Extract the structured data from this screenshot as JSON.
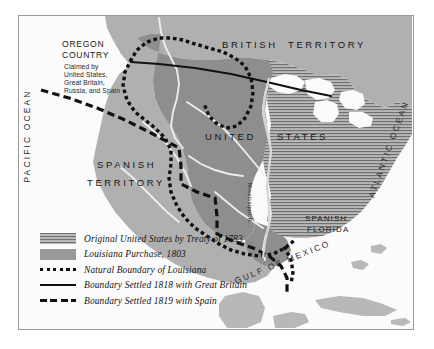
{
  "map": {
    "title_regions": {
      "british_territory": "BRITISH  TERRITORY",
      "united_states": "UNITED    STATES",
      "spanish_territory_line1": "SPANISH",
      "spanish_territory_line2": "TERRITORY",
      "spanish_florida_line1": "SPANISH",
      "spanish_florida_line2": "FLORIDA",
      "oregon_line1": "OREGON",
      "oregon_line2": "COUNTRY",
      "oregon_claim_line1": "Claimed by",
      "oregon_claim_line2": "United States,",
      "oregon_claim_line3": "Great Britain,",
      "oregon_claim_line4": "Russia, and Spain"
    },
    "water_labels": {
      "pacific_ocean": "PACIFIC OCEAN",
      "atlantic_ocean": "ATLANTIC OCEAN",
      "gulf_of_mexico": "GULF OF MEXICO",
      "mississippi_river": "Mississippi R."
    },
    "colors": {
      "louisiana_purchase_fill": "#8e8e8e",
      "spanish_territory_fill": "#b0b0b0",
      "british_territory_fill": "#b0b0b0",
      "original_us_hatch_dark": "#6f6f6f",
      "original_us_hatch_light": "#b9b9b9",
      "water_fill": "#fbfbfb",
      "river_color": "#ededed",
      "boundary_color": "#111111",
      "frame_color": "#9a9a9a"
    },
    "legend": {
      "items": [
        {
          "key": "hatch-swatch",
          "label": "Original United States by Treaty of 1783"
        },
        {
          "key": "solid-swatch",
          "label": "Louisiana Purchase, 1803"
        },
        {
          "key": "dotted-line",
          "label": "Natural Boundary of Louisiana"
        },
        {
          "key": "solid-line",
          "label": "Boundary Settled 1818 with Great Britain"
        },
        {
          "key": "dashed-line",
          "label": "Boundary Settled 1819 with Spain"
        }
      ]
    }
  }
}
